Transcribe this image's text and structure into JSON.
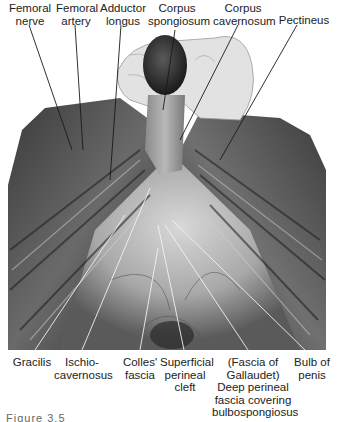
{
  "figure": {
    "type": "anatomical-dissection-photograph",
    "colors": {
      "background": "#ffffff",
      "label_text": "#222222",
      "leader_line": "#1a1a1a",
      "photo_dark": "#2b2b2b",
      "photo_mid": "#6e6e6e",
      "photo_light": "#c9c9c9",
      "glove": "#e4e4e4"
    },
    "top_labels": [
      {
        "id": "femoral-nerve",
        "lines": [
          "Femoral",
          "nerve"
        ]
      },
      {
        "id": "femoral-artery",
        "lines": [
          "Femoral",
          "artery"
        ]
      },
      {
        "id": "adductor-longus",
        "lines": [
          "Adductor",
          "longus"
        ]
      },
      {
        "id": "corpus-spongiosum",
        "lines": [
          "Corpus",
          "spongiosum"
        ]
      },
      {
        "id": "corpus-cavernosum",
        "lines": [
          "Corpus",
          "cavernosum"
        ]
      },
      {
        "id": "pectineus",
        "lines": [
          "Pectineus"
        ]
      }
    ],
    "bottom_labels": [
      {
        "id": "gracilis",
        "lines": [
          "Gracilis"
        ]
      },
      {
        "id": "ischiocavernosus",
        "lines": [
          "Ischio-",
          "cavernosus"
        ]
      },
      {
        "id": "colles-fascia",
        "lines": [
          "Colles'",
          "fascia"
        ]
      },
      {
        "id": "superficial-perineal-cleft",
        "lines": [
          "Superficial",
          "perineal",
          "cleft"
        ]
      },
      {
        "id": "deep-perineal-fascia",
        "lines": [
          "(Fascia of",
          "Gallaudet)",
          "Deep perineal",
          "fascia covering",
          "bulbospongiosus"
        ]
      },
      {
        "id": "bulb-of-penis",
        "lines": [
          "Bulb of",
          "penis"
        ]
      }
    ],
    "caption": "Figure 3.5"
  }
}
